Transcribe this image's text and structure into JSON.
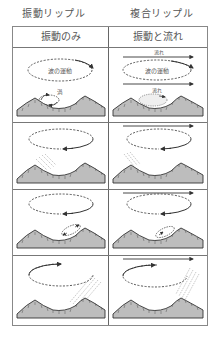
{
  "titles": {
    "left": "振動リップル",
    "right": "複合リップル"
  },
  "table": {
    "headers": [
      "振動のみ",
      "振動と流れ"
    ],
    "rows": [
      {
        "stage": 1,
        "left": {
          "labels": {
            "wave_motion": "波の運動",
            "vortex": "渦"
          }
        },
        "right": {
          "labels": {
            "flow_top": "流れ",
            "wave_motion": "波の運動",
            "flow_bottom": "流れ"
          }
        }
      },
      {
        "stage": 2,
        "left": {
          "labels": {}
        },
        "right": {
          "labels": {}
        }
      },
      {
        "stage": 3,
        "left": {
          "labels": {}
        },
        "right": {
          "labels": {}
        }
      },
      {
        "stage": 4,
        "left": {
          "labels": {}
        },
        "right": {
          "labels": {}
        }
      }
    ]
  },
  "colors": {
    "line": "#333333",
    "sediment_fill": "#bdbdbd",
    "border": "#777777",
    "text": "#555555"
  }
}
